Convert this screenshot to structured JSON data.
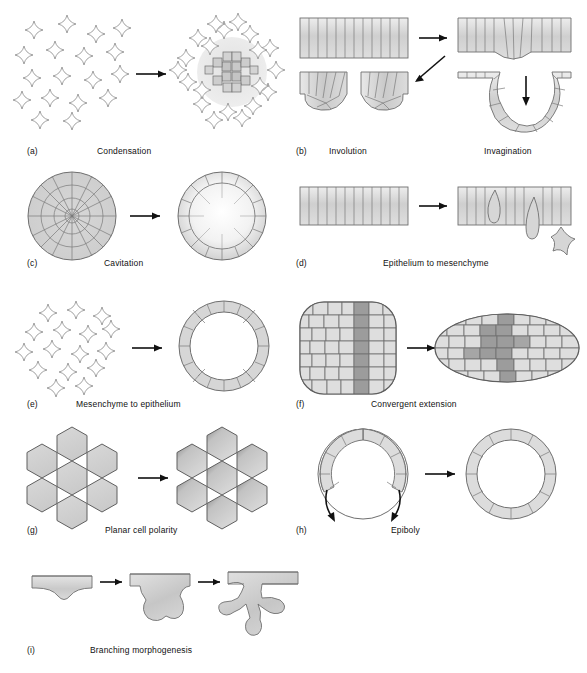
{
  "figure": {
    "panel_count": 9,
    "style": {
      "cell_fill_light": "#dcdcdc",
      "cell_fill_mid": "#c8c8c8",
      "cell_fill_dark": "#9a9a9a",
      "outline": "#6f6f6f",
      "arrow": "#111111",
      "background": "#ffffff"
    }
  },
  "panels": [
    {
      "letter": "(a)",
      "label": "Condensation",
      "stages": [
        "dispersed mesenchymal cells",
        "condensed cell cluster"
      ],
      "cell_shape": "four-pointed-star",
      "arrow_count": 1
    },
    {
      "letter": "(b)",
      "label": "Involution",
      "second_label": "Invagination",
      "stages": [
        "flat epithelial sheet",
        "involuted sheet",
        "invaginated sheet",
        "deep invagination"
      ],
      "cell_shape": "columnar",
      "arrow_count": 3
    },
    {
      "letter": "(c)",
      "label": "Cavitation",
      "stages": [
        "solid cell ball",
        "hollow cell ball with cavity"
      ],
      "cell_shape": "polygonal",
      "arrow_count": 1
    },
    {
      "letter": "(d)",
      "label": "Epithelium to mesenchyme",
      "stages": [
        "intact epithelial sheet",
        "cells delaminating from sheet"
      ],
      "cell_shape": "columnar",
      "arrow_count": 1
    },
    {
      "letter": "(e)",
      "label": "Mesenchyme to epithelium",
      "stages": [
        "dispersed mesenchymal cells",
        "epithelial ring"
      ],
      "cell_shape": "four-pointed-star",
      "arrow_count": 1
    },
    {
      "letter": "(f)",
      "label": "Convergent extension",
      "stages": [
        "square tissue with vertical stripe",
        "elongated tissue with dispersed stripe"
      ],
      "cell_shape": "brick",
      "arrow_count": 1
    },
    {
      "letter": "(g)",
      "label": "Planar cell polarity",
      "stages": [
        "unpolarized hexagonal cells",
        "polarized hexagonal cells"
      ],
      "cell_shape": "hexagon",
      "arrow_count": 1
    },
    {
      "letter": "(h)",
      "label": "Epiboly",
      "stages": [
        "partial cell layer",
        "complete cell layer"
      ],
      "cell_shape": "arc-segment",
      "arrow_count": 3
    },
    {
      "letter": "(i)",
      "label": "Branching morphogenesis",
      "stages": [
        "shallow bud",
        "lobed outgrowth",
        "branched tree"
      ],
      "cell_shape": "epithelial-tube",
      "arrow_count": 2
    }
  ]
}
